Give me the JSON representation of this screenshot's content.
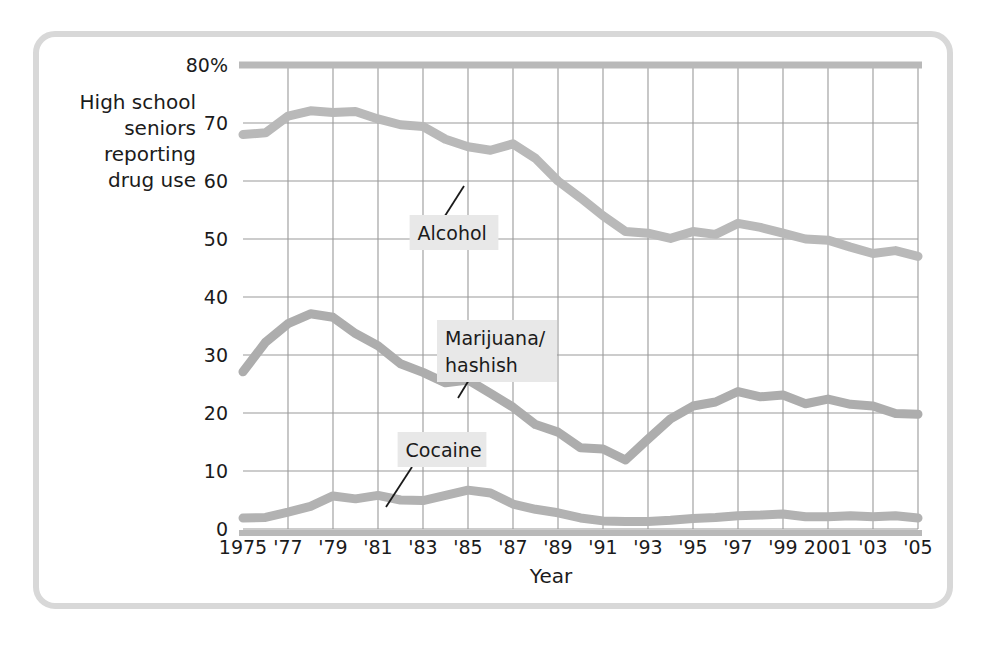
{
  "figure": {
    "frame_color": "#d8d8d8",
    "background": "#ffffff"
  },
  "chart_data": {
    "type": "line",
    "title": "",
    "xlabel": "Year",
    "ylabel": "High school seniors reporting drug use",
    "ylabel_lines": [
      "High school",
      "seniors",
      "reporting",
      "drug use"
    ],
    "grid": true,
    "legend_position": "inline-annotations",
    "xlim": [
      1975,
      2005
    ],
    "ylim": [
      0,
      80
    ],
    "yticks": [
      0,
      10,
      20,
      30,
      40,
      50,
      60,
      70,
      80
    ],
    "ytick_labels": [
      "0",
      "10",
      "20",
      "30",
      "40",
      "50",
      "60",
      "70",
      "80%"
    ],
    "xticks": [
      1975,
      1977,
      1979,
      1981,
      1983,
      1985,
      1987,
      1989,
      1991,
      1993,
      1995,
      1997,
      1999,
      2001,
      2003,
      2005
    ],
    "xtick_labels": [
      "1975",
      "'77",
      "'79",
      "'81",
      "'83",
      "'85",
      "'87",
      "'89",
      "'91",
      "'93",
      "'95",
      "'97",
      "'99",
      "2001",
      "'03",
      "'05"
    ],
    "x": [
      1975,
      1976,
      1977,
      1978,
      1979,
      1980,
      1981,
      1982,
      1983,
      1984,
      1985,
      1986,
      1987,
      1988,
      1989,
      1990,
      1991,
      1992,
      1993,
      1994,
      1995,
      1996,
      1997,
      1998,
      1999,
      2000,
      2001,
      2002,
      2003,
      2004,
      2005
    ],
    "series": [
      {
        "name": "Alcohol",
        "color": "#b9b9b9",
        "values": [
          68,
          68.3,
          71.2,
          72.1,
          71.8,
          72.0,
          70.7,
          69.7,
          69.4,
          67.2,
          65.9,
          65.3,
          66.4,
          63.9,
          60.0,
          57.1,
          54.0,
          51.3,
          51.0,
          50.1,
          51.3,
          50.8,
          52.7,
          52.0,
          51.0,
          50.0,
          49.8,
          48.6,
          47.5,
          48.0,
          47.0
        ]
      },
      {
        "name": "Marijuana/hashish",
        "color": "#adadad",
        "values": [
          27.1,
          32.2,
          35.4,
          37.1,
          36.5,
          33.7,
          31.6,
          28.5,
          27.0,
          25.2,
          25.7,
          23.4,
          21.0,
          18.0,
          16.7,
          14.0,
          13.8,
          11.9,
          15.5,
          19.0,
          21.2,
          21.9,
          23.7,
          22.8,
          23.1,
          21.6,
          22.4,
          21.5,
          21.2,
          19.9,
          19.8
        ]
      },
      {
        "name": "Cocaine",
        "color": "#b2b2b2",
        "values": [
          1.9,
          2.0,
          2.9,
          3.9,
          5.7,
          5.2,
          5.8,
          5.0,
          4.9,
          5.8,
          6.7,
          6.2,
          4.3,
          3.4,
          2.8,
          1.9,
          1.4,
          1.3,
          1.3,
          1.5,
          1.8,
          2.0,
          2.3,
          2.4,
          2.6,
          2.1,
          2.1,
          2.3,
          2.1,
          2.3,
          1.9
        ]
      }
    ],
    "annotations": [
      {
        "label": "Alcohol",
        "text_lines": [
          "Alcohol"
        ],
        "label_x": 454,
        "label_y": 240,
        "leader_from_x": 436,
        "leader_from_y": 230,
        "leader_to_x": 464,
        "leader_to_y": 186
      },
      {
        "label": "Marijuana/hashish",
        "text_lines": [
          "Marijuana/",
          "hashish"
        ],
        "label_x": 497,
        "label_y": 345,
        "leader_from_x": 472,
        "leader_from_y": 375,
        "leader_to_x": 458,
        "leader_to_y": 398
      },
      {
        "label": "Cocaine",
        "text_lines": [
          "Cocaine"
        ],
        "label_x": 442,
        "label_y": 457,
        "leader_from_x": 412,
        "leader_from_y": 467,
        "leader_to_x": 386,
        "leader_to_y": 507
      }
    ]
  }
}
